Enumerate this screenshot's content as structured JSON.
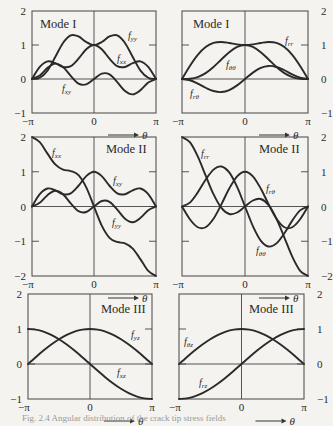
{
  "figure": {
    "caption": "Fig. 2.4  Angular distribution of the crack tip stress fields"
  },
  "chart_data": [
    {
      "id": "mode1-cartesian",
      "type": "line",
      "title": "Mode I",
      "xlabel": "θ",
      "x_ticks": [
        "−π",
        "0",
        "π"
      ],
      "ylim": [
        -1,
        2
      ],
      "y_ticks": [
        "2",
        "1",
        "0",
        "−1"
      ],
      "y_axis_side": "left",
      "grid": false,
      "x": [
        -3.1416,
        -2.7489,
        -2.3562,
        -1.9635,
        -1.5708,
        -1.1781,
        -0.7854,
        -0.3927,
        0,
        0.3927,
        0.7854,
        1.1781,
        1.5708,
        1.9635,
        2.3562,
        2.7489,
        3.1416
      ],
      "series": [
        {
          "name": "f_yy",
          "label": "f",
          "sub": "yy",
          "values": [
            0,
            0.036,
            0.247,
            0.646,
            1.061,
            1.285,
            1.251,
            1.087,
            1,
            1.087,
            1.251,
            1.285,
            1.061,
            0.646,
            0.247,
            0.036,
            0
          ]
        },
        {
          "name": "f_xx",
          "label": "f",
          "sub": "xx",
          "values": [
            0,
            0.354,
            0.518,
            0.466,
            0.354,
            0.378,
            0.597,
            0.875,
            1,
            0.875,
            0.597,
            0.378,
            0.354,
            0.466,
            0.518,
            0.354,
            0
          ]
        },
        {
          "name": "f_xy",
          "label": "f",
          "sub": "xy",
          "values": [
            0,
            0.106,
            0.327,
            0.453,
            0.354,
            0.09,
            -0.135,
            -0.159,
            0,
            0.159,
            0.135,
            -0.09,
            -0.354,
            -0.453,
            -0.327,
            -0.106,
            0
          ]
        }
      ]
    },
    {
      "id": "mode1-polar",
      "type": "line",
      "title": "Mode I",
      "xlabel": "θ",
      "x_ticks": [
        "−π",
        "0",
        "π"
      ],
      "ylim": [
        -1,
        2
      ],
      "y_ticks": [
        "2",
        "1",
        "0",
        "−1"
      ],
      "y_axis_side": "right",
      "grid": false,
      "x": [
        -3.1416,
        -2.7489,
        -2.3562,
        -1.9635,
        -1.5708,
        -1.1781,
        -0.7854,
        -0.3927,
        0,
        0.3927,
        0.7854,
        1.1781,
        1.5708,
        1.9635,
        2.3562,
        2.7489,
        3.1416
      ],
      "series": [
        {
          "name": "f_rr",
          "label": "f",
          "sub": "rr",
          "values": [
            0,
            0.383,
            0.709,
            0.94,
            1.061,
            1.088,
            1.059,
            1.018,
            1,
            1.018,
            1.059,
            1.088,
            1.061,
            0.94,
            0.709,
            0.383,
            0
          ]
        },
        {
          "name": "f_θθ",
          "label": "f",
          "sub": "θθ",
          "values": [
            0,
            0.007,
            0.056,
            0.172,
            0.354,
            0.575,
            0.789,
            0.944,
            1,
            0.944,
            0.789,
            0.575,
            0.354,
            0.172,
            0.056,
            0.007,
            0
          ]
        },
        {
          "name": "f_rθ",
          "label": "f",
          "sub": "rθ",
          "values": [
            0,
            -0.037,
            -0.135,
            -0.257,
            -0.354,
            -0.384,
            -0.327,
            -0.188,
            0,
            0.188,
            0.327,
            0.384,
            0.354,
            0.257,
            0.135,
            0.037,
            0
          ]
        }
      ]
    },
    {
      "id": "mode2-cartesian",
      "type": "line",
      "title": "Mode II",
      "xlabel": "θ",
      "x_ticks": [
        "−π",
        "0",
        "π"
      ],
      "ylim": [
        -2,
        2
      ],
      "y_ticks": [
        "2",
        "1",
        "0",
        "−1",
        "−2"
      ],
      "y_axis_side": "left",
      "grid": false,
      "x": [
        -3.1416,
        -2.7489,
        -2.3562,
        -1.9635,
        -1.5708,
        -1.1781,
        -0.7854,
        -0.3927,
        0,
        0.3927,
        0.7854,
        1.1781,
        1.5708,
        1.9635,
        2.3562,
        2.7489,
        3.1416
      ],
      "series": [
        {
          "name": "f_xx",
          "label": "f",
          "sub": "xx",
          "values": [
            2,
            1.855,
            1.521,
            1.21,
            1.061,
            1.021,
            0.901,
            0.549,
            0,
            -0.549,
            -0.901,
            -1.021,
            -1.061,
            -1.21,
            -1.521,
            -1.855,
            -2
          ]
        },
        {
          "name": "f_xy",
          "label": "f",
          "sub": "xy",
          "values": [
            0,
            0.354,
            0.518,
            0.466,
            0.354,
            0.378,
            0.597,
            0.875,
            1,
            0.875,
            0.597,
            0.378,
            0.354,
            0.466,
            0.518,
            0.354,
            0
          ]
        },
        {
          "name": "f_yy",
          "label": "f",
          "sub": "yy",
          "values": [
            0,
            0.106,
            0.327,
            0.453,
            0.354,
            0.09,
            -0.135,
            -0.159,
            0,
            0.159,
            0.135,
            -0.09,
            -0.354,
            -0.453,
            -0.327,
            -0.106,
            0
          ]
        }
      ]
    },
    {
      "id": "mode2-polar",
      "type": "line",
      "title": "Mode II",
      "xlabel": "θ",
      "x_ticks": [
        "−π",
        "0",
        "π"
      ],
      "ylim": [
        -2,
        2
      ],
      "y_ticks": [
        "2",
        "1",
        "0",
        "−1",
        "−2"
      ],
      "y_axis_side": "right",
      "grid": false,
      "x": [
        -3.1416,
        -2.7489,
        -2.3562,
        -1.9635,
        -1.5708,
        -1.1781,
        -0.7854,
        -0.3927,
        0,
        0.3927,
        0.7854,
        1.1781,
        1.5708,
        1.9635,
        2.3562,
        2.7489,
        3.1416
      ],
      "series": [
        {
          "name": "f_rr",
          "label": "f",
          "sub": "rr",
          "values": [
            2,
            1.85,
            1.442,
            0.893,
            0.354,
            -0.041,
            -0.215,
            -0.173,
            0,
            0.173,
            0.215,
            0.041,
            -0.354,
            -0.893,
            -1.442,
            -1.85,
            -2
          ]
        },
        {
          "name": "f_rθ",
          "label": "f",
          "sub": "rθ",
          "values": [
            0,
            -0.368,
            -0.597,
            -0.597,
            -0.354,
            0.062,
            0.518,
            0.869,
            1,
            0.869,
            0.518,
            0.062,
            -0.354,
            -0.597,
            -0.597,
            -0.368,
            0
          ]
        },
        {
          "name": "f_θθ",
          "label": "f",
          "sub": "θθ",
          "values": [
            0,
            0.112,
            0.406,
            0.77,
            1.061,
            1.152,
            0.98,
            0.563,
            0,
            -0.563,
            -0.98,
            -1.152,
            -1.061,
            -0.77,
            -0.406,
            -0.112,
            0
          ]
        }
      ]
    },
    {
      "id": "mode3-cartesian",
      "type": "line",
      "title": "Mode III",
      "xlabel": "θ",
      "x_ticks": [
        "−π",
        "0",
        "π"
      ],
      "ylim": [
        -1,
        2
      ],
      "y_ticks": [
        "2",
        "1",
        "0",
        "−1"
      ],
      "y_axis_side": "left",
      "grid": false,
      "x": [
        -3.1416,
        -2.7489,
        -2.3562,
        -1.9635,
        -1.5708,
        -1.1781,
        -0.7854,
        -0.3927,
        0,
        0.3927,
        0.7854,
        1.1781,
        1.5708,
        1.9635,
        2.3562,
        2.7489,
        3.1416
      ],
      "series": [
        {
          "name": "f_yz",
          "label": "f",
          "sub": "yz",
          "values": [
            0,
            0.195,
            0.383,
            0.556,
            0.707,
            0.831,
            0.924,
            0.981,
            1,
            0.981,
            0.924,
            0.831,
            0.707,
            0.556,
            0.383,
            0.195,
            0
          ]
        },
        {
          "name": "f_xz",
          "label": "f",
          "sub": "xz",
          "values": [
            1,
            0.981,
            0.924,
            0.831,
            0.707,
            0.556,
            0.383,
            0.195,
            0,
            -0.195,
            -0.383,
            -0.556,
            -0.707,
            -0.831,
            -0.924,
            -0.981,
            -1
          ]
        }
      ]
    },
    {
      "id": "mode3-polar",
      "type": "line",
      "title": "Mode III",
      "xlabel": "θ",
      "x_ticks": [
        "−π",
        "0",
        "π"
      ],
      "ylim": [
        -1,
        2
      ],
      "y_ticks": [
        "2",
        "1",
        "0",
        "−1"
      ],
      "y_axis_side": "right",
      "grid": false,
      "x": [
        -3.1416,
        -2.7489,
        -2.3562,
        -1.9635,
        -1.5708,
        -1.1781,
        -0.7854,
        -0.3927,
        0,
        0.3927,
        0.7854,
        1.1781,
        1.5708,
        1.9635,
        2.3562,
        2.7489,
        3.1416
      ],
      "series": [
        {
          "name": "f_θz",
          "label": "f",
          "sub": "θz",
          "values": [
            0,
            0.195,
            0.383,
            0.556,
            0.707,
            0.831,
            0.924,
            0.981,
            1,
            0.981,
            0.924,
            0.831,
            0.707,
            0.556,
            0.383,
            0.195,
            0
          ]
        },
        {
          "name": "f_rz",
          "label": "f",
          "sub": "rz",
          "values": [
            -1,
            -0.981,
            -0.924,
            -0.831,
            -0.707,
            -0.556,
            -0.383,
            -0.195,
            0,
            0.195,
            0.383,
            0.556,
            0.707,
            0.831,
            0.924,
            0.981,
            1
          ]
        }
      ]
    }
  ],
  "layout": {
    "panels": [
      {
        "left": 32,
        "right": 156,
        "top": 11,
        "bottom": 113,
        "title_x": 40,
        "title_y": 28,
        "labels": [
          {
            "s": 0,
            "x": 128,
            "y": 39
          },
          {
            "s": 1,
            "x": 117,
            "y": 62
          },
          {
            "s": 2,
            "x": 62,
            "y": 92
          }
        ]
      },
      {
        "left": 182,
        "right": 308,
        "top": 11,
        "bottom": 113,
        "title_x": 193,
        "title_y": 28,
        "labels": [
          {
            "s": 0,
            "x": 285,
            "y": 44
          },
          {
            "s": 1,
            "x": 226,
            "y": 68
          },
          {
            "s": 2,
            "x": 190,
            "y": 97
          }
        ]
      },
      {
        "left": 32,
        "right": 156,
        "top": 137,
        "bottom": 276,
        "title_x": 106,
        "title_y": 153,
        "labels": [
          {
            "s": 0,
            "x": 52,
            "y": 156
          },
          {
            "s": 1,
            "x": 113,
            "y": 184
          },
          {
            "s": 2,
            "x": 112,
            "y": 226
          }
        ]
      },
      {
        "left": 182,
        "right": 308,
        "top": 137,
        "bottom": 276,
        "title_x": 259,
        "title_y": 153,
        "labels": [
          {
            "s": 0,
            "x": 201,
            "y": 157
          },
          {
            "s": 1,
            "x": 266,
            "y": 192
          },
          {
            "s": 2,
            "x": 256,
            "y": 254
          }
        ]
      },
      {
        "left": 28,
        "right": 152,
        "top": 294,
        "bottom": 399,
        "title_x": 101,
        "title_y": 313,
        "labels": [
          {
            "s": 0,
            "x": 131,
            "y": 338
          },
          {
            "s": 1,
            "x": 117,
            "y": 376
          }
        ]
      },
      {
        "left": 179,
        "right": 304,
        "top": 294,
        "bottom": 399,
        "title_x": 249,
        "title_y": 313,
        "labels": [
          {
            "s": 0,
            "x": 184,
            "y": 345
          },
          {
            "s": 1,
            "x": 199,
            "y": 386
          }
        ]
      }
    ]
  }
}
